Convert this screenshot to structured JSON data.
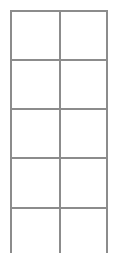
{
  "grid": {
    "columns": 2,
    "rows_visible": 5,
    "line_color": "#8c8c8c",
    "background": "#ffffff",
    "top_border": true,
    "bottom_border": false,
    "frame": {
      "left": 10,
      "right": 106,
      "top": 10,
      "bottom": 253
    },
    "vertical_lines_x": [
      10,
      59,
      106
    ],
    "horizontal_lines_y": [
      10,
      59,
      108,
      157,
      207
    ]
  }
}
